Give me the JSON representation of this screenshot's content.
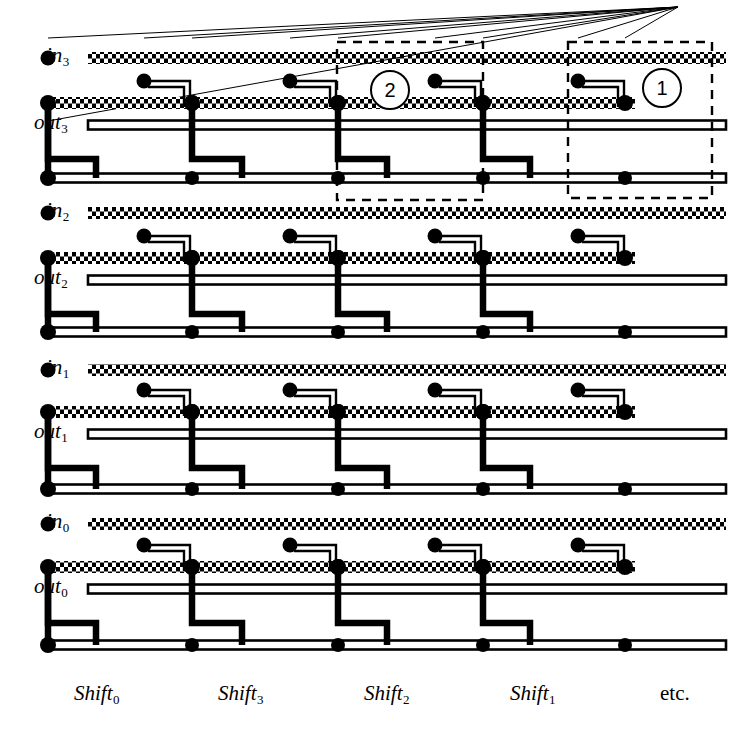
{
  "figure": {
    "type": "vlsi-layout-diagram",
    "width": 755,
    "height": 734,
    "background": "#ffffff",
    "ink": "#000000"
  },
  "row_labels": [
    {
      "id": "in3",
      "base": "in",
      "sub": "3",
      "y": 58,
      "kind": "poly-input"
    },
    {
      "id": "out3",
      "base": "out",
      "sub": "3",
      "y": 125,
      "kind": "metal-output"
    },
    {
      "id": "in2",
      "base": "in",
      "sub": "2",
      "y": 213,
      "kind": "poly-input"
    },
    {
      "id": "out2",
      "base": "out",
      "sub": "2",
      "y": 280,
      "kind": "metal-output"
    },
    {
      "id": "in1",
      "base": "in",
      "sub": "1",
      "y": 370,
      "kind": "poly-input"
    },
    {
      "id": "out1",
      "base": "out",
      "sub": "1",
      "y": 434,
      "kind": "metal-output"
    },
    {
      "id": "in0",
      "base": "in",
      "sub": "0",
      "y": 524,
      "kind": "poly-input"
    },
    {
      "id": "out0",
      "base": "out",
      "sub": "0",
      "y": 589,
      "kind": "metal-output"
    }
  ],
  "column_labels": [
    {
      "id": "shift0",
      "base": "Shift",
      "sub": "0",
      "x": 74,
      "italic": true
    },
    {
      "id": "shift3",
      "base": "Shift",
      "sub": "3",
      "x": 218,
      "italic": true
    },
    {
      "id": "shift2",
      "base": "Shift",
      "sub": "2",
      "x": 364,
      "italic": true
    },
    {
      "id": "shift1",
      "base": "Shift",
      "sub": "1",
      "x": 510,
      "italic": true
    },
    {
      "id": "etc",
      "base": "etc.",
      "sub": "",
      "x": 660,
      "italic": false
    }
  ],
  "callouts": [
    {
      "id": "callout-2",
      "label": "2",
      "cx": 390,
      "cy": 90
    },
    {
      "id": "callout-1",
      "label": "1",
      "cx": 662,
      "cy": 88
    }
  ],
  "dashed_cells": [
    {
      "id": "cell-2",
      "x": 337,
      "y": 42,
      "w": 146,
      "h": 158
    },
    {
      "id": "cell-1",
      "x": 568,
      "y": 42,
      "w": 144,
      "h": 156
    }
  ],
  "geometry": {
    "columns_x": [
      48,
      144,
      192,
      290,
      338,
      435,
      483,
      578,
      625
    ],
    "cell_pitch": 146,
    "cell_pairs_x": [
      [
        144,
        192
      ],
      [
        290,
        338
      ],
      [
        435,
        483
      ],
      [
        578,
        625
      ]
    ],
    "poly_rows_y": [
      58,
      213,
      370,
      524
    ],
    "metal_out_rows_y": [
      125,
      280,
      434,
      589
    ],
    "return_rails_y": [
      178,
      332,
      489,
      645
    ],
    "left_bus_x": 48,
    "right_edge_x": 718,
    "left_label_edge_x": 88,
    "shift_bus_y": 645,
    "vertical_top_y": 38,
    "vertical_bottom_y": 678
  },
  "legend": {
    "poly_layer": "hatched horizontal strip (polysilicon input line)",
    "metal_layer": "thin double line (metal output line)",
    "diffusion": "thick black vertical/stepped line",
    "contact": "solid black dot"
  }
}
